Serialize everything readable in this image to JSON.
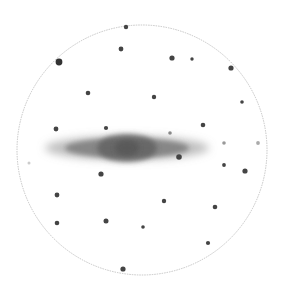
{
  "sketch": {
    "subject": "edge-on galaxy eyepiece sketch",
    "background": "#ffffff",
    "field_of_view": {
      "cx": 142,
      "cy": 150,
      "r": 125,
      "stroke": "#b8b8b8"
    },
    "galaxy": {
      "cx": 127,
      "cy": 148,
      "halo": {
        "rx": 82,
        "ry": 12,
        "color": "#8a8a8a",
        "opacity": 0.55
      },
      "disk": {
        "rx": 62,
        "ry": 10,
        "color": "#6e6e6e",
        "opacity": 0.7
      },
      "bulge": {
        "rx": 30,
        "ry": 14,
        "color": "#5e5e5e",
        "opacity": 0.75
      },
      "core": {
        "rx": 12,
        "ry": 8,
        "color": "#555555",
        "opacity": 0.8
      }
    },
    "stars": [
      {
        "x": 126,
        "y": 27,
        "r": 2.2,
        "c": "#444"
      },
      {
        "x": 121,
        "y": 49,
        "r": 2.4,
        "c": "#444"
      },
      {
        "x": 59,
        "y": 62,
        "r": 3.4,
        "c": "#333"
      },
      {
        "x": 172,
        "y": 58,
        "r": 2.6,
        "c": "#444"
      },
      {
        "x": 192,
        "y": 59,
        "r": 1.7,
        "c": "#444"
      },
      {
        "x": 231,
        "y": 68,
        "r": 2.6,
        "c": "#444"
      },
      {
        "x": 88,
        "y": 93,
        "r": 2.3,
        "c": "#444"
      },
      {
        "x": 154,
        "y": 97,
        "r": 2.2,
        "c": "#444"
      },
      {
        "x": 242,
        "y": 102,
        "r": 1.8,
        "c": "#444"
      },
      {
        "x": 56,
        "y": 129,
        "r": 2.4,
        "c": "#444"
      },
      {
        "x": 106,
        "y": 128,
        "r": 2.1,
        "c": "#444"
      },
      {
        "x": 203,
        "y": 125,
        "r": 2.3,
        "c": "#444"
      },
      {
        "x": 170,
        "y": 133,
        "r": 1.8,
        "c": "#888"
      },
      {
        "x": 179,
        "y": 157,
        "r": 2.8,
        "c": "#444"
      },
      {
        "x": 224,
        "y": 143,
        "r": 1.8,
        "c": "#999"
      },
      {
        "x": 258,
        "y": 143,
        "r": 1.9,
        "c": "#aaa"
      },
      {
        "x": 224,
        "y": 165,
        "r": 1.9,
        "c": "#444"
      },
      {
        "x": 245,
        "y": 171,
        "r": 2.6,
        "c": "#444"
      },
      {
        "x": 101,
        "y": 174,
        "r": 2.6,
        "c": "#444"
      },
      {
        "x": 29,
        "y": 163,
        "r": 1.5,
        "c": "#ccc"
      },
      {
        "x": 57,
        "y": 195,
        "r": 2.4,
        "c": "#444"
      },
      {
        "x": 164,
        "y": 201,
        "r": 2.2,
        "c": "#444"
      },
      {
        "x": 215,
        "y": 207,
        "r": 2.3,
        "c": "#444"
      },
      {
        "x": 57,
        "y": 223,
        "r": 2.3,
        "c": "#444"
      },
      {
        "x": 106,
        "y": 221,
        "r": 2.5,
        "c": "#444"
      },
      {
        "x": 143,
        "y": 227,
        "r": 1.8,
        "c": "#444"
      },
      {
        "x": 208,
        "y": 243,
        "r": 2.1,
        "c": "#444"
      },
      {
        "x": 123,
        "y": 269,
        "r": 2.6,
        "c": "#444"
      }
    ]
  }
}
